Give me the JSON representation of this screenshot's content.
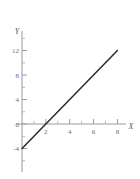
{
  "figure": {
    "background_color": "#ffffff",
    "axis_color": "#9a9a9a",
    "line_color": "#2b2b2b",
    "tick_label_color": "#6e6e6e",
    "axis_name_color": "#5a5a5a"
  },
  "chart_data": {
    "type": "line",
    "title": "",
    "subtitle": "",
    "xlabel": "X",
    "ylabel": "Y",
    "xlim": [
      -0.6,
      9.2
    ],
    "ylim": [
      -6.5,
      14.5
    ],
    "grid": false,
    "legend": null,
    "x_major_ticks": [
      2,
      4,
      6,
      8
    ],
    "x_major_tick_labels": [
      "2",
      "4",
      "6",
      "8"
    ],
    "x_minor_ticks": [
      1,
      3,
      5,
      7,
      9
    ],
    "y_major_ticks": [
      -4,
      0,
      4,
      8,
      12
    ],
    "y_major_tick_labels": [
      "-4",
      "0",
      "4",
      "8",
      "12"
    ],
    "y_minor_ticks": [
      -6,
      -2,
      2,
      6,
      10,
      14
    ],
    "series": [
      {
        "name": "y = 2x - 4",
        "equation": "y = 2x - 4",
        "slope": 2,
        "intercept": -4,
        "x": [
          0,
          2,
          8
        ],
        "values": [
          -4,
          0,
          12
        ],
        "points": [
          {
            "x": 0,
            "y": -4
          },
          {
            "x": 2,
            "y": 0
          },
          {
            "x": 8,
            "y": 12
          }
        ],
        "color": "#2b2b2b"
      }
    ],
    "annotations": []
  },
  "axes": {
    "x_axis_label": "X",
    "y_axis_label": "Y"
  },
  "labels": {
    "x": [
      "2",
      "4",
      "6",
      "8"
    ],
    "y": [
      "12",
      "8",
      "4",
      "0",
      "-4"
    ]
  }
}
